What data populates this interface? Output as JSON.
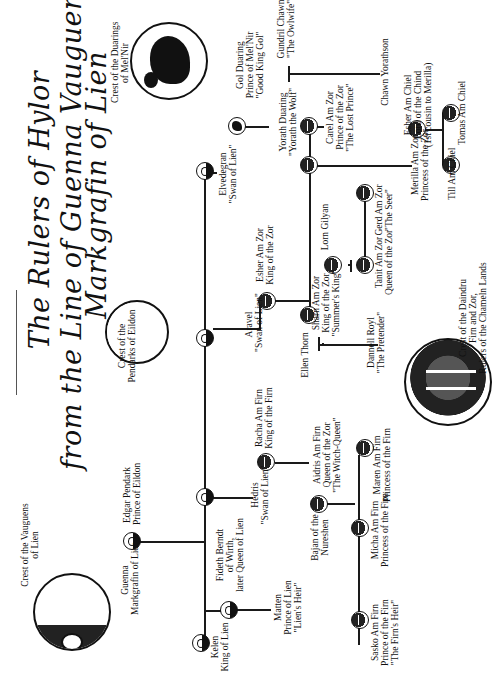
{
  "title": {
    "line1": "The Rulers of Hylor",
    "line2": "from the Line of Guenna Vauguens,",
    "line3": "Markgrafin of Lien"
  },
  "crests": {
    "duarings": "Crest of the Duarings\nof Mel'Nir",
    "pendarks": "Crest of the\nPendarks of Eildon",
    "vauguens": "Crest of the Vauguens\nof Lien",
    "daindru": "Crest of the Daindru\nFirn and Zor,\nRulers of the Chameln Lands"
  },
  "people": {
    "gol": "Gol Duaring\nPrince of Mel'Nir\n\"Good King Gol\"",
    "gundril": "Gundril Chawn\n\"The Owlwife\"",
    "elvedegran": "Elvedegran\n\"Swan of Lien\"",
    "yorath": "Yorath Duaring\n\"Yorath the Wolf\"",
    "chawn": "Chawn Yorathson",
    "carel": "Carel Am Zor\nPrince of the Zor\n\"The Lost Prince\"",
    "esher_chiel": "Esher Am Chiel\nLord of the Chind\n(1st cousin to Merilla)",
    "merilla": "Merilla Am Zor\nPrincess of the Zor",
    "till": "Till Am Chiel",
    "tomas": "Tomas Am Chiel",
    "esher_zor": "Esher Am Zor\nKing of the Zor",
    "lorn": "Lorn Gilyan",
    "gerd": "Gerd Am Zor\n\"The Seer\"",
    "tanit": "Tanit Am Zor\nQueen of the Zor",
    "sharn": "Sharn Am Zor\nKing of the Zor\n\"Summer's King\"",
    "aravel": "Aravel\n\"Swan of Lien\"",
    "ellen": "Ellen Thorn",
    "dannell": "Dannell Royl\n\"The Pretender\"",
    "racha": "Racha Am Firn\nKing of the Firn",
    "hedris": "Hedris\n\"Swan of Lien\"",
    "aidris": "Aidris Am Firn\nQueen of the Zor\n\"The Witch-Queen\"",
    "bajan": "Bajan of the\nNureshen",
    "maren": "Maren Am Firn\nPrincess of the Firn",
    "micha": "Micha Am Firn\nPrincess of the Firn",
    "sasko": "Sasko Am Firn\nPrince of the Firn\n\"The Firn's Heir\"",
    "edgar": "Edgar Pendark\nPrince of Eildon",
    "guenna": "Guenna\nMarkgrafin of Lien",
    "fideth": "Fideth Berndt\nof Wirth,\nlater Queen of Lien",
    "matten": "Matten\nPrince of Lien\n\"Lien's Heir\"",
    "kelen": "Kelen\nKing of Lien"
  }
}
